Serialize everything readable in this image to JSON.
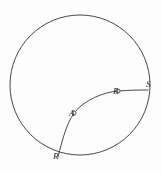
{
  "figure": {
    "kind": "geometry-diagram",
    "background_color": "#fdfdfd",
    "stroke_color": "#4a4a4a",
    "label_color": "#2b2b2b",
    "stroke_width": 1,
    "canvas": {
      "width": 162,
      "height": 173
    },
    "circle": {
      "name": "boundary-circle",
      "cx": 80,
      "cy": 85,
      "r": 70
    },
    "curve": {
      "name": "arc-R-to-S",
      "path": "M 58 157 C 63 138 66 125 74 113 C 84 100 104 92 118 91 C 130 90 140 90 148 90"
    },
    "points": [
      {
        "id": "R",
        "label": "R",
        "cx": 58,
        "cy": 157,
        "marker": false,
        "label_x": 53,
        "label_y": 160
      },
      {
        "id": "A",
        "label": "A",
        "cx": 74,
        "cy": 113,
        "marker": true,
        "label_x": 69,
        "label_y": 117
      },
      {
        "id": "B",
        "label": "B",
        "cx": 118,
        "cy": 91,
        "marker": true,
        "label_x": 113,
        "label_y": 95
      },
      {
        "id": "S",
        "label": "S",
        "cx": 148,
        "cy": 90,
        "marker": false,
        "label_x": 146,
        "label_y": 88
      }
    ]
  }
}
